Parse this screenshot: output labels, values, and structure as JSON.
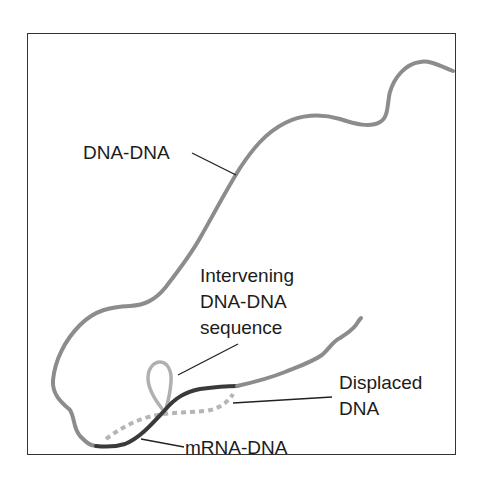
{
  "figure": {
    "labels": {
      "dna_dna": "DNA-DNA",
      "intervening_line1": "Intervening",
      "intervening_line2": "DNA-DNA",
      "intervening_line3": "sequence",
      "displaced_line1": "Displaced",
      "displaced_line2": "DNA",
      "mrna_dna": "mRNA-DNA"
    },
    "colors": {
      "dna_strand": "#8c8c8c",
      "mrna_dna_strand": "#3a3a3a",
      "displaced_dna": "#b5b5b5",
      "loop": "#b0b0b0",
      "leader_line": "#222222",
      "frame": "#333333",
      "text": "#1c1c1c"
    }
  }
}
